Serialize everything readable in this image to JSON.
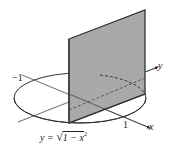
{
  "figure": {
    "colors": {
      "surface_fill": "#a9a9a9",
      "surface_edge": "#333333",
      "lines": "#333333",
      "background": "#ffffff"
    },
    "labels": {
      "neg_one": "−1",
      "y_axis": "y",
      "one": "1",
      "x_axis": "x",
      "equation_lhs": "y = ",
      "equation_sqrt": "√",
      "equation_radicand": "1 − x",
      "equation_exp": "2"
    },
    "geometry": {
      "ellipse": {
        "cx": 80,
        "cy": 98,
        "rx": 66,
        "ry": 25
      },
      "plane": [
        [
          69,
          39
        ],
        [
          145,
          10
        ],
        [
          145,
          94
        ],
        [
          69,
          123
        ]
      ],
      "x_axis": {
        "from": [
          22,
          75
        ],
        "to": [
          150,
          128
        ]
      },
      "y_axis": {
        "from": [
          18,
          122
        ],
        "to": [
          158,
          67
        ]
      }
    }
  }
}
